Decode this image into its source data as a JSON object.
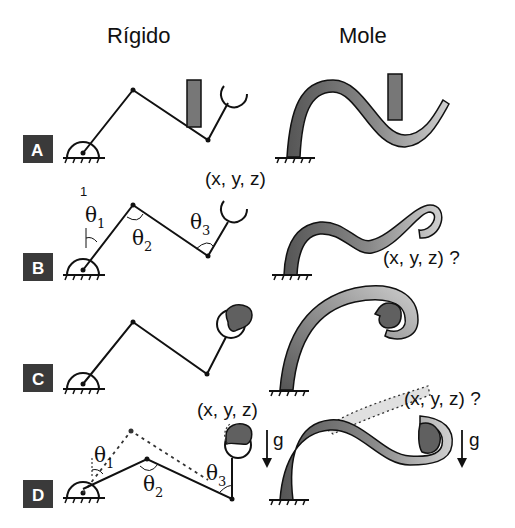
{
  "headers": {
    "rigid": "Rígido",
    "soft": "Mole"
  },
  "rows": [
    {
      "badge": "A",
      "description": "Rigid arm reaching past obstacle; soft arm bending around obstacle"
    },
    {
      "badge": "B",
      "description": "Rigid arm with joint angles; soft arm end-effector position uncertain"
    },
    {
      "badge": "C",
      "description": "Both arms grasping an object"
    },
    {
      "badge": "D",
      "description": "Effect of gravity under load"
    }
  ],
  "labels": {
    "coord_known": "(x, y, z)",
    "coord_unknown": "(x, y, z) ?",
    "theta": "θ",
    "theta_subs": [
      "1",
      "2",
      "3"
    ],
    "gravity": "g",
    "stray_one": "1"
  },
  "colors": {
    "badge_bg": "#3a3a3a",
    "link": "#111111",
    "obstacle": "#707070",
    "soft_dark": "#5a5a5a",
    "soft_light": "#c8c8c8",
    "object": "#606060",
    "ghost": "#dcdcdc"
  }
}
